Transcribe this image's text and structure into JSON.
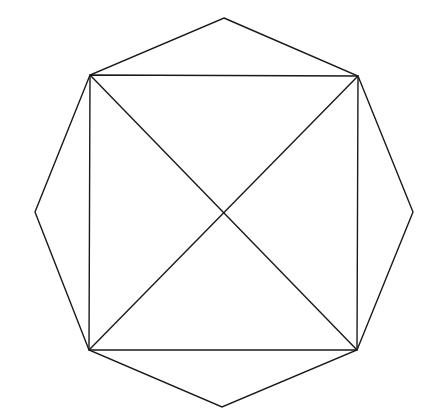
{
  "diagram": {
    "stroke_color": "#1a1a1a",
    "background": "#ffffff",
    "octagon": {
      "points": [
        [
          224,
          18
        ],
        [
          358,
          76
        ],
        [
          413,
          212
        ],
        [
          357,
          350
        ],
        [
          222,
          407
        ],
        [
          89,
          350
        ],
        [
          35,
          212
        ],
        [
          90,
          75
        ]
      ]
    },
    "square": {
      "points": [
        [
          90,
          75
        ],
        [
          358,
          76
        ],
        [
          357,
          350
        ],
        [
          89,
          350
        ]
      ]
    },
    "diagonals": [
      {
        "from": [
          90,
          75
        ],
        "to": [
          357,
          350
        ]
      },
      {
        "from": [
          358,
          76
        ],
        "to": [
          89,
          350
        ]
      }
    ],
    "center": [
      223,
      212
    ]
  }
}
